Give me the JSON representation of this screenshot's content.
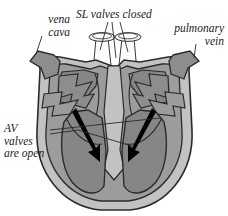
{
  "figure": {
    "background_color": "#ffffff"
  },
  "palette": {
    "outer_wall": "#c2c2c2",
    "myocardium": "#9c9c9c",
    "chamber": "#868686",
    "vessel_stub": "#8d8d8d",
    "tube_white": "#fdfdfd",
    "outline": "#2b2b2b",
    "arrow": "#000000",
    "text": "#1a1a1a"
  },
  "labels": {
    "vena_cava": {
      "line1": "vena",
      "line2": "cava"
    },
    "sl_valves": {
      "line1": "SL valves closed"
    },
    "pulmonary_vein": {
      "line1": "pulmonary",
      "line2": "vein"
    },
    "av_valves": {
      "line1": "AV",
      "line2": "valves",
      "line3": "are open"
    }
  },
  "structures": [
    {
      "name": "superior-vena-cava-stub",
      "side": "left"
    },
    {
      "name": "pulmonary-vein-stub",
      "side": "right"
    },
    {
      "name": "aorta-tube",
      "side": "center-left"
    },
    {
      "name": "pulmonary-artery-tube",
      "side": "center-right"
    },
    {
      "name": "right-atrium",
      "side": "left"
    },
    {
      "name": "left-atrium",
      "side": "right"
    },
    {
      "name": "right-ventricle",
      "side": "left"
    },
    {
      "name": "left-ventricle",
      "side": "right"
    },
    {
      "name": "interventricular-septum",
      "side": "center"
    },
    {
      "name": "semilunar-valve-left",
      "state": "closed"
    },
    {
      "name": "semilunar-valve-right",
      "state": "closed"
    },
    {
      "name": "av-valve-left",
      "state": "open"
    },
    {
      "name": "av-valve-right",
      "state": "open"
    }
  ],
  "flow_arrows": [
    {
      "name": "blood-flow-arrow-left",
      "direction": "down-right",
      "描述": "into right ventricle"
    },
    {
      "name": "blood-flow-arrow-right",
      "direction": "down-left"
    }
  ]
}
